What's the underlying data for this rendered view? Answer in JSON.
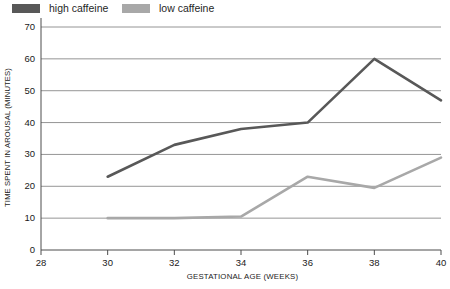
{
  "chart_data": {
    "type": "line",
    "title": "",
    "xlabel": "GESTATIONAL AGE (WEEKS)",
    "ylabel": "TIME SPENT IN AROUSAL (MINUTES)",
    "x": [
      30,
      32,
      34,
      36,
      38,
      40
    ],
    "xlim": [
      28,
      40
    ],
    "ylim": [
      0,
      70
    ],
    "xticks": [
      28,
      30,
      32,
      34,
      36,
      38,
      40
    ],
    "yticks": [
      0,
      10,
      20,
      30,
      40,
      50,
      60,
      70
    ],
    "grid": "horizontal",
    "legend_position": "top-left",
    "series": [
      {
        "name": "high caffeine",
        "color": "#585858",
        "values": [
          23,
          33,
          38,
          40,
          60,
          47
        ]
      },
      {
        "name": "low caffeine",
        "color": "#a8a8a8",
        "values": [
          10,
          10,
          10.5,
          23,
          19.5,
          29
        ]
      }
    ]
  },
  "axis": {
    "x_title": "GESTATIONAL AGE (WEEKS)",
    "y_title": "TIME SPENT IN AROUSAL (MINUTES)",
    "x_tick_labels": [
      "28",
      "30",
      "32",
      "34",
      "36",
      "38",
      "40"
    ],
    "y_tick_labels": [
      "0",
      "10",
      "20",
      "30",
      "40",
      "50",
      "60",
      "70"
    ]
  },
  "legend": {
    "items": [
      {
        "label": "high caffeine",
        "color": "#585858"
      },
      {
        "label": "low caffeine",
        "color": "#a8a8a8"
      }
    ]
  },
  "colors": {
    "high_caffeine": "#585858",
    "low_caffeine": "#a8a8a8",
    "gridline": "#7a7a7a",
    "axis": "#4d4d4d",
    "background": "#ffffff",
    "text": "#1a1a1a"
  }
}
